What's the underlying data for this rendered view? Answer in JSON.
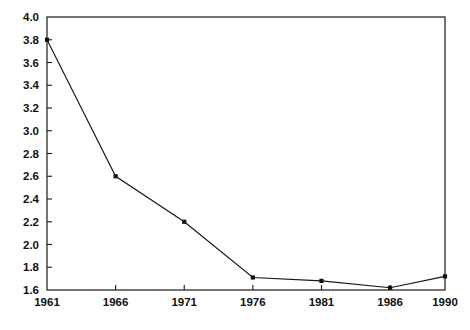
{
  "chart_data": {
    "type": "line",
    "title": "",
    "subtitle": "",
    "xlabel": "",
    "ylabel": "",
    "x": [
      1961,
      1966,
      1971,
      1976,
      1981,
      1986,
      1990
    ],
    "categories": [
      "1961",
      "1966",
      "1971",
      "1976",
      "1981",
      "1986",
      "1990"
    ],
    "values": [
      3.8,
      2.6,
      2.2,
      1.71,
      1.68,
      1.62,
      1.72
    ],
    "series": [
      {
        "name": "series-1",
        "values": [
          3.8,
          2.6,
          2.2,
          1.71,
          1.68,
          1.62,
          1.72
        ]
      }
    ],
    "xlim": [
      1961,
      1990
    ],
    "ylim": [
      1.6,
      4.0
    ],
    "y_ticks": [
      1.6,
      1.8,
      2.0,
      2.2,
      2.4,
      2.6,
      2.8,
      3.0,
      3.2,
      3.4,
      3.6,
      3.8,
      4.0
    ],
    "y_tick_labels": [
      "1.6",
      "1.8",
      "2.0",
      "2.2",
      "2.4",
      "2.6",
      "2.8",
      "3.0",
      "3.2",
      "3.4",
      "3.6",
      "3.8",
      "4.0"
    ],
    "x_ticks": [
      1961,
      1966,
      1971,
      1976,
      1981,
      1986,
      1990
    ],
    "x_tick_labels": [
      "1961",
      "1966",
      "1971",
      "1976",
      "1981",
      "1986",
      "1990"
    ],
    "grid": false,
    "legend": null,
    "legend_position": "none",
    "annotations": [],
    "markers": "square",
    "line_color": "#161616",
    "marker_color": "#111111",
    "axis_color": "#1a1a1a",
    "background_color": "#ffffff"
  },
  "plot_box": {
    "left": 47,
    "top": 17,
    "right": 445,
    "bottom": 290
  }
}
